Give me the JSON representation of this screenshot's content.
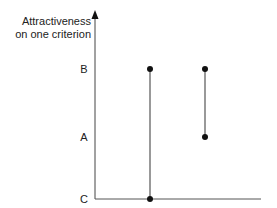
{
  "axis": {
    "y_label_line1": "Attractiveness",
    "y_label_line2": "on one criterion"
  },
  "levels": [
    {
      "label": "B",
      "y": 69
    },
    {
      "label": "A",
      "y": 137
    },
    {
      "label": "C",
      "y": 199
    }
  ],
  "segments": [
    {
      "x": 150,
      "y_top": 69,
      "y_bottom": 199,
      "from": "B",
      "to": "C"
    },
    {
      "x": 205,
      "y_top": 69,
      "y_bottom": 137,
      "from": "B",
      "to": "A"
    }
  ],
  "colors": {
    "axis": "#333333",
    "segment": "#555555",
    "point": "#111111"
  }
}
